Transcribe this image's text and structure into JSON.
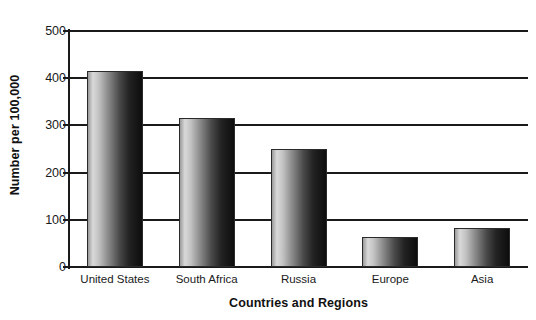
{
  "chart_data": {
    "type": "bar",
    "title": "",
    "categories": [
      "United States",
      "South Africa",
      "Russia",
      "Europe",
      "Asia"
    ],
    "values": [
      415,
      315,
      250,
      64,
      82
    ],
    "xlabel": "Countries and Regions",
    "ylabel": "Number per 100,000",
    "ylim": [
      0,
      500
    ],
    "yticks": [
      0,
      100,
      200,
      300,
      400,
      500
    ],
    "ytick_labels": [
      "0",
      "100",
      "200",
      "300",
      "400",
      "500"
    ],
    "grid": "horizontal",
    "legend": "none",
    "bar_style": "horizontal-gradient-light-to-dark"
  },
  "colors": {
    "axis": "#1a1a1a",
    "grid": "#1a1a1a",
    "bar_light": "#d9d9d9",
    "bar_dark": "#0d0d0d",
    "background": "#ffffff",
    "text": "#111111"
  }
}
